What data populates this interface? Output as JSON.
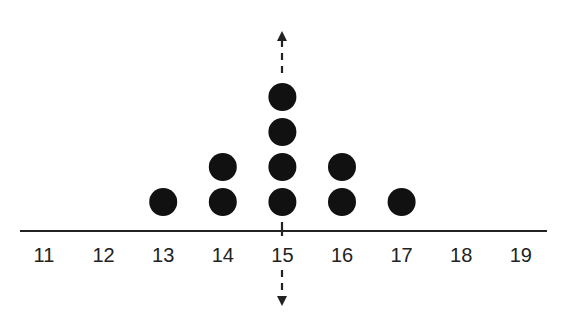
{
  "chart_data": {
    "type": "scatter",
    "subtype": "dot_plot",
    "title": "",
    "xlabel": "",
    "ylabel": "",
    "x_ticks": [
      "11",
      "12",
      "13",
      "14",
      "15",
      "16",
      "17",
      "18",
      "19"
    ],
    "categories": [
      11,
      12,
      13,
      14,
      15,
      16,
      17,
      18,
      19
    ],
    "counts": [
      0,
      0,
      1,
      2,
      4,
      2,
      1,
      0,
      0
    ],
    "points": [
      {
        "x": 13,
        "y": 1
      },
      {
        "x": 14,
        "y": 1
      },
      {
        "x": 14,
        "y": 2
      },
      {
        "x": 15,
        "y": 1
      },
      {
        "x": 15,
        "y": 2
      },
      {
        "x": 15,
        "y": 3
      },
      {
        "x": 15,
        "y": 4
      },
      {
        "x": 16,
        "y": 1
      },
      {
        "x": 16,
        "y": 2
      },
      {
        "x": 17,
        "y": 1
      }
    ],
    "xlim": [
      11,
      19
    ],
    "annotations": [
      {
        "type": "dashed_vertical_line_with_arrows",
        "x": 15,
        "label": "line of symmetry"
      }
    ],
    "grid": false,
    "colors": {
      "dot": "#111111",
      "axis": "#222222"
    }
  }
}
